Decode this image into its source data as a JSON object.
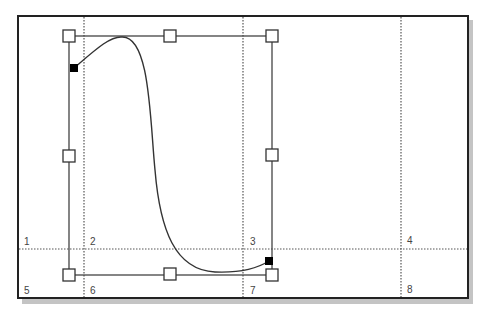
{
  "diagram": {
    "region_labels": [
      "1",
      "2",
      "3",
      "4",
      "5",
      "6",
      "7",
      "8"
    ],
    "colors": {
      "frame": "#222222",
      "shadow": "#bbbbbb",
      "grid": "#555555",
      "curve": "#333333",
      "handle_fill": "#ffffff",
      "anchor_fill": "#000000"
    }
  }
}
